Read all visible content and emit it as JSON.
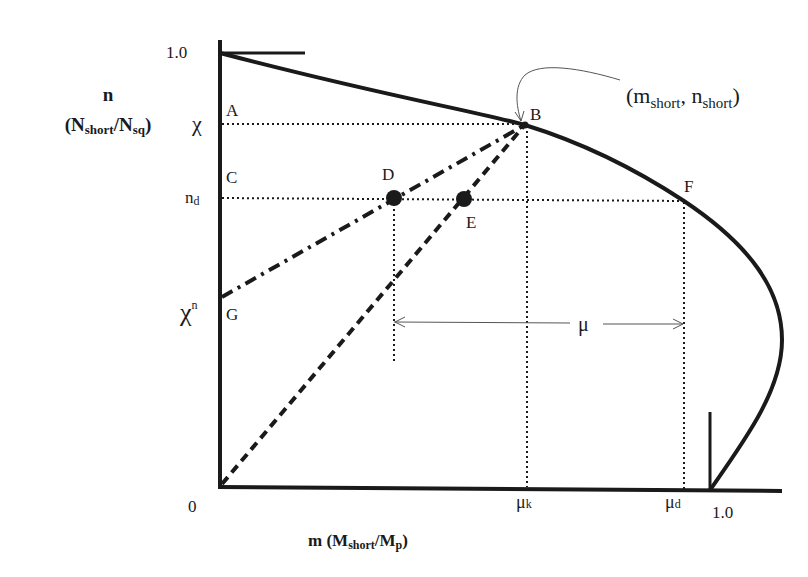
{
  "diagram": {
    "type": "interaction-curve",
    "y_axis": {
      "label_main": "n",
      "label_sub_open": "(N",
      "label_sub_1": "short",
      "label_slash": "/N",
      "label_sub_2": "sq",
      "label_close": ")",
      "tick_top": "1.0",
      "tick_chi": "χ",
      "tick_nd_base": "n",
      "tick_nd_sub": "d",
      "tick_chin_base": "χ",
      "tick_chin_sup": "n"
    },
    "x_axis": {
      "label_m": "m (M",
      "label_sub_1": "short",
      "label_slash": "/M",
      "label_sub_2": "p",
      "label_close": ")",
      "tick_origin": "0",
      "tick_muk_base": "μ",
      "tick_muk_sub": "k",
      "tick_mud_base": "μ",
      "tick_mud_sub": "d",
      "tick_one": "1.0"
    },
    "points": {
      "A": "A",
      "B": "B",
      "C": "C",
      "D": "D",
      "E": "E",
      "F": "F",
      "G": "G"
    },
    "annotation": {
      "open": "(m",
      "sub1": "short",
      "comma": ", n",
      "sub2": "short",
      "close": ")"
    },
    "mu_label": "μ",
    "colors": {
      "ink": "#1a1a1a",
      "thin": "#555555",
      "background": "#ffffff"
    }
  }
}
